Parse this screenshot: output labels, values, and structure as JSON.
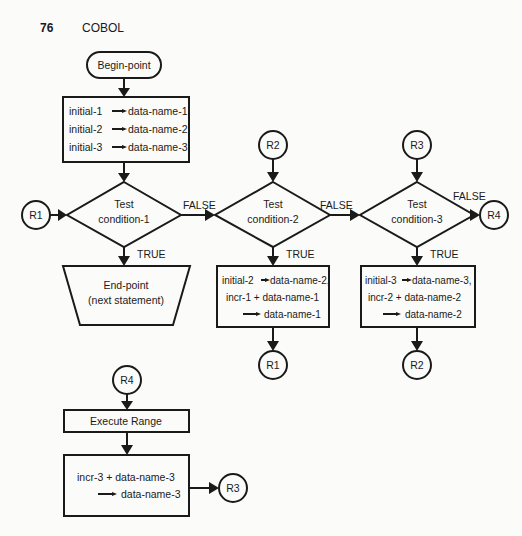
{
  "page": {
    "number": "76",
    "title": "COBOL"
  },
  "nodes": {
    "begin": {
      "label": "Begin-point"
    },
    "init_box": {
      "lines": [
        "initial-1",
        "data-name-1,",
        "initial-2",
        "data-name-2,",
        "initial-3",
        "data-name-3."
      ]
    },
    "cond1": {
      "line1": "Test",
      "line2": "condition-1"
    },
    "cond2": {
      "line1": "Test",
      "line2": "condition-2"
    },
    "cond3": {
      "line1": "Test",
      "line2": "condition-3"
    },
    "end": {
      "line1": "End-point",
      "line2": "(next statement)"
    },
    "box2": {
      "l1a": "initial-2",
      "l1b": "data-name-2,",
      "l2": "incr-1  + data-name-1",
      "l3": "data-name-1"
    },
    "box3": {
      "l1a": "initial-3",
      "l1b": "data-name-3,",
      "l2": "incr-2  + data-name-2",
      "l3": "data-name-2"
    },
    "execute": {
      "label": "Execute Range"
    },
    "box4": {
      "l1": "incr-3  +  data-name-3",
      "l2": "data-name-3"
    }
  },
  "connectors": {
    "r1_left": "R1",
    "r2_top": "R2",
    "r3_top": "R3",
    "r4_right": "R4",
    "r1_bottom": "R1",
    "r2_bottom": "R2",
    "r4_lower": "R4",
    "r3_lower": "R3"
  },
  "edge_labels": {
    "c1_false": "FALSE",
    "c2_false": "FALSE",
    "c3_false": "FALSE",
    "c1_true": "TRUE",
    "c2_true": "TRUE",
    "c3_true": "TRUE"
  }
}
